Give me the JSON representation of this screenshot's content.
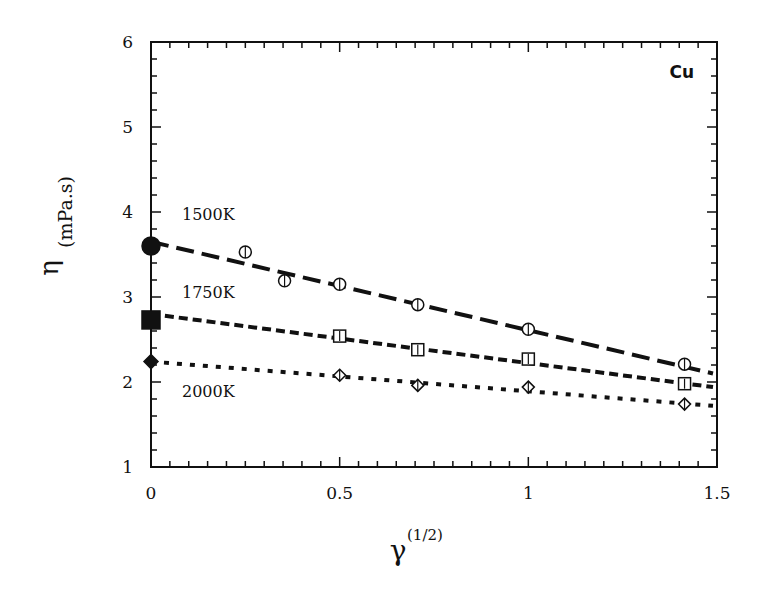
{
  "chart_data": {
    "type": "scatter",
    "title": "",
    "annotation": "Cu",
    "xlabel": "γ",
    "xlabel_superscript": "(1/2)",
    "ylabel": "η",
    "ylabel_unit": "(mPa.s)",
    "xlim": [
      0,
      1.5
    ],
    "ylim": [
      1,
      6
    ],
    "xticks": [
      0,
      0.5,
      1,
      1.5
    ],
    "xtick_labels": [
      "0",
      "0.5",
      "1",
      "1.5"
    ],
    "yticks": [
      1,
      2,
      3,
      4,
      5,
      6
    ],
    "ytick_labels": [
      "1",
      "2",
      "3",
      "4",
      "5",
      "6"
    ],
    "grid": false,
    "legend": "inline labels",
    "series": [
      {
        "name": "1500K",
        "marker": "circle",
        "line_style": "long-dash",
        "x": [
          0,
          0.25,
          0.354,
          0.5,
          0.707,
          1.0,
          1.414
        ],
        "y": [
          3.6,
          3.53,
          3.19,
          3.15,
          2.91,
          2.62,
          2.21
        ],
        "fit": {
          "x0": 0,
          "y0": 3.65,
          "x1": 1.5,
          "y1": 2.1
        }
      },
      {
        "name": "1750K",
        "marker": "square",
        "line_style": "short-dash",
        "x": [
          0,
          0.5,
          0.707,
          1.0,
          1.414
        ],
        "y": [
          2.73,
          2.54,
          2.38,
          2.27,
          1.98
        ],
        "fit": {
          "x0": 0,
          "y0": 2.8,
          "x1": 1.5,
          "y1": 1.94
        }
      },
      {
        "name": "2000K",
        "marker": "diamond",
        "line_style": "dotted",
        "x": [
          0,
          0.5,
          0.707,
          1.0,
          1.414
        ],
        "y": [
          2.24,
          2.08,
          1.96,
          1.94,
          1.74
        ],
        "fit": {
          "x0": 0,
          "y0": 2.24,
          "x1": 1.5,
          "y1": 1.72
        }
      }
    ]
  }
}
